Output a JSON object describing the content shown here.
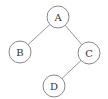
{
  "diagram": {
    "type": "binary-tree",
    "nodes": [
      {
        "id": "A",
        "label": "A",
        "x": 58,
        "y": 17,
        "r": 11
      },
      {
        "id": "B",
        "label": "B",
        "x": 20,
        "y": 52,
        "r": 11
      },
      {
        "id": "C",
        "label": "C",
        "x": 89,
        "y": 53,
        "r": 11
      },
      {
        "id": "D",
        "label": "D",
        "x": 54,
        "y": 86,
        "r": 11
      }
    ],
    "edges": [
      {
        "from": "A",
        "to": "B"
      },
      {
        "from": "A",
        "to": "C"
      },
      {
        "from": "C",
        "to": "D"
      }
    ],
    "colors": {
      "edge": "#8a8a8a",
      "node_stroke": "#7a7a7a",
      "label": "#333333",
      "background": "#ffffff"
    }
  }
}
